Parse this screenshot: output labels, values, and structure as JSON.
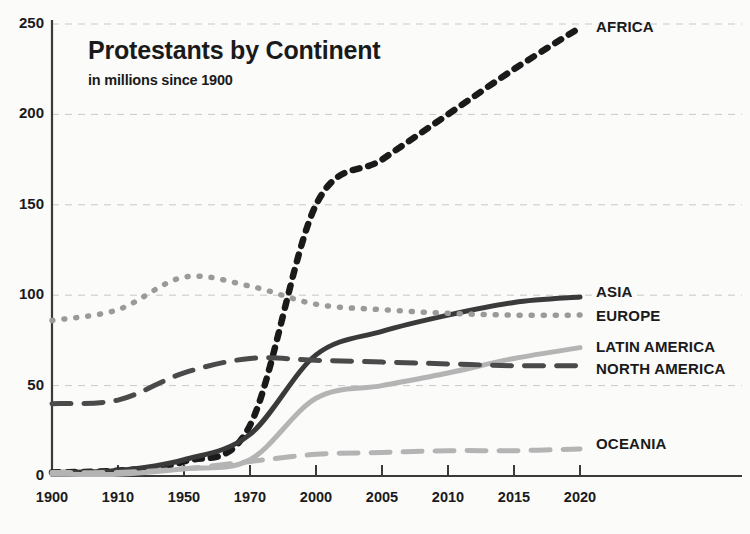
{
  "chart_data": {
    "type": "line",
    "title": "Protestants by Continent",
    "subtitle": "in millions since 1900",
    "xlabel": "",
    "ylabel": "",
    "ylim": [
      0,
      250
    ],
    "yticks": [
      0,
      50,
      100,
      150,
      200,
      250
    ],
    "grid": true,
    "legend_position": "right-inline-labels",
    "categories": [
      "1900",
      "1910",
      "1950",
      "1970",
      "2000",
      "2005",
      "2010",
      "2015",
      "2020"
    ],
    "series": [
      {
        "name": "AFRICA",
        "style": "dotted-thick",
        "color": "#1a1a1a",
        "values": [
          2,
          3,
          8,
          28,
          150,
          175,
          200,
          225,
          248
        ]
      },
      {
        "name": "ASIA",
        "style": "solid",
        "color": "#3a3a3a",
        "values": [
          2,
          3,
          9,
          23,
          67,
          80,
          89,
          96,
          99
        ]
      },
      {
        "name": "EUROPE",
        "style": "dotted",
        "color": "#9a9a9a",
        "values": [
          86,
          92,
          110,
          105,
          95,
          92,
          90,
          89,
          89
        ]
      },
      {
        "name": "LATIN AMERICA",
        "style": "solid",
        "color": "#b4b4b4",
        "values": [
          1,
          1,
          4,
          9,
          43,
          50,
          57,
          65,
          71
        ]
      },
      {
        "name": "NORTH AMERICA",
        "style": "dashed",
        "color": "#4a4a4a",
        "values": [
          40,
          42,
          57,
          65,
          64,
          63,
          62,
          61,
          61
        ]
      },
      {
        "name": "OCEANIA",
        "style": "dashed",
        "color": "#b4b4b4",
        "values": [
          2,
          2,
          4,
          8,
          12,
          13,
          14,
          14,
          15
        ]
      }
    ]
  },
  "axis": {
    "y_tick_labels": [
      "250",
      "200",
      "150",
      "100",
      "50",
      "0"
    ],
    "x_tick_labels": [
      "1900",
      "1910",
      "1950",
      "1970",
      "2000",
      "2005",
      "2010",
      "2015",
      "2020"
    ]
  },
  "series_labels": [
    {
      "name": "AFRICA",
      "text": "AFRICA"
    },
    {
      "name": "ASIA",
      "text": "ASIA"
    },
    {
      "name": "EUROPE",
      "text": "EUROPE"
    },
    {
      "name": "LATIN AMERICA",
      "text": "LATIN AMERICA"
    },
    {
      "name": "NORTH AMERICA",
      "text": "NORTH AMERICA"
    },
    {
      "name": "OCEANIA",
      "text": "OCEANIA"
    }
  ]
}
